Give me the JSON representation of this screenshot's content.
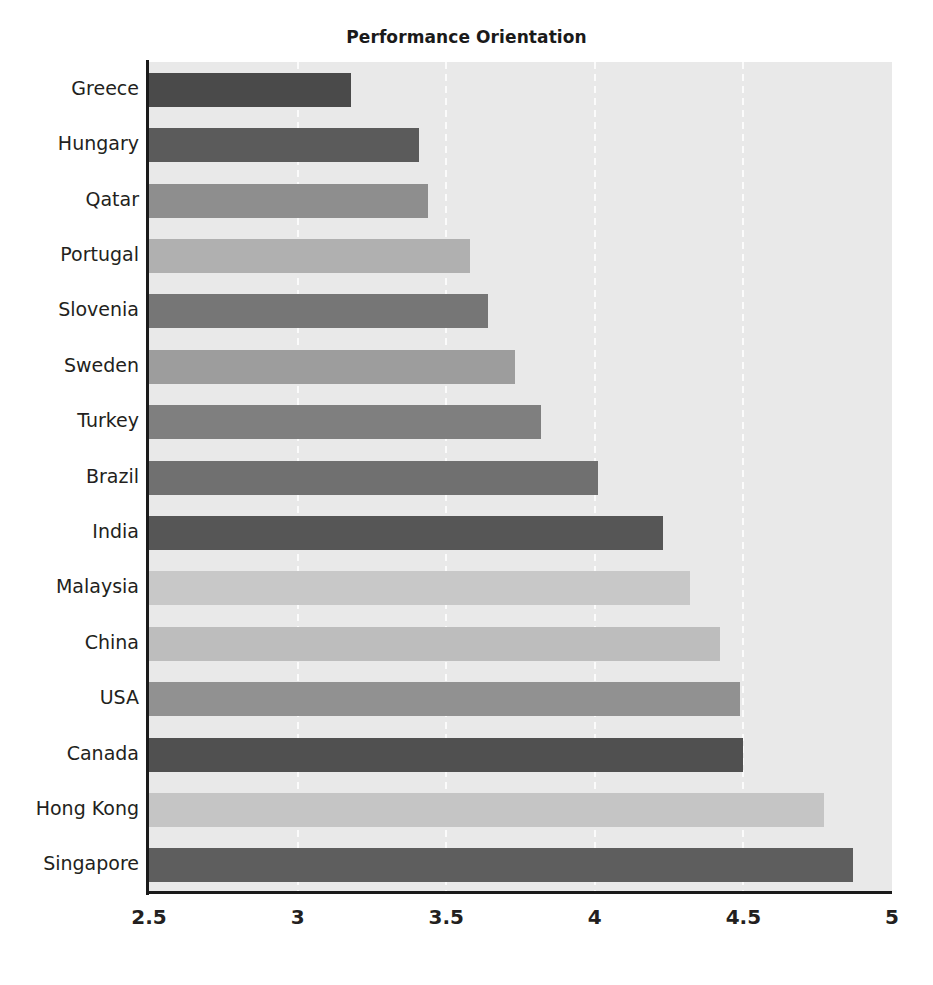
{
  "chart_data": {
    "type": "bar",
    "orientation": "horizontal",
    "title": "Performance Orientation",
    "xlabel": "",
    "ylabel": "",
    "xlim": [
      2.5,
      5
    ],
    "ylim": null,
    "grid": true,
    "gridlines_axis": "x",
    "legend": null,
    "xticks": [
      "2.5",
      "3",
      "3.5",
      "4",
      "4.5",
      "5"
    ],
    "xtick_values": [
      2.5,
      3,
      3.5,
      4,
      4.5,
      5
    ],
    "categories": [
      "Greece",
      "Hungary",
      "Qatar",
      "Portugal",
      "Slovenia",
      "Sweden",
      "Turkey",
      "Brazil",
      "India",
      "Malaysia",
      "China",
      "USA",
      "Canada",
      "Hong Kong",
      "Singapore"
    ],
    "values": [
      3.18,
      3.41,
      3.44,
      3.58,
      3.64,
      3.73,
      3.82,
      4.01,
      4.23,
      4.32,
      4.42,
      4.49,
      4.5,
      4.77,
      4.87
    ],
    "bar_colors": [
      "#4a4a4a",
      "#5b5b5b",
      "#8e8e8e",
      "#b0b0b0",
      "#767676",
      "#9d9d9d",
      "#7f7f7f",
      "#707070",
      "#565656",
      "#c8c8c8",
      "#bdbdbd",
      "#919191",
      "#505050",
      "#c5c5c5",
      "#5e5e5e"
    ],
    "plot_background": "#e9e9e9",
    "gridline_color": "#fbfbfb",
    "axis_color": "#1a1a1a"
  }
}
